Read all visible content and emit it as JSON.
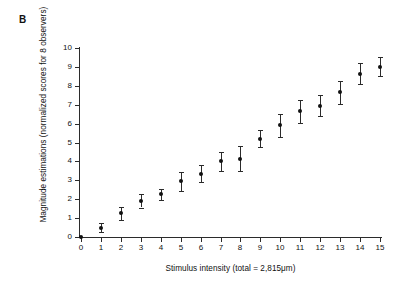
{
  "figure": {
    "panel_label": "B"
  },
  "chart_data": {
    "type": "scatter",
    "title": "",
    "subtitle": "",
    "xlabel": "Stimulus intensity (total = 2,815μm)",
    "ylabel": "Magnitude estimations (normalized scores for 8 observers)",
    "xlim": [
      0,
      15
    ],
    "ylim": [
      0,
      10
    ],
    "grid": false,
    "legend": null,
    "xticks": [
      "0",
      "1",
      "2",
      "3",
      "4",
      "5",
      "6",
      "7",
      "8",
      "9",
      "10",
      "11",
      "12",
      "13",
      "14",
      "15"
    ],
    "yticks": [
      "0",
      "1",
      "2",
      "3",
      "4",
      "5",
      "6",
      "7",
      "8",
      "9",
      "10"
    ],
    "marker_color": "#111111",
    "errorbar_color": "#2b2b2b",
    "axis_color": "#2b2b2b",
    "x": [
      0,
      1,
      2,
      3,
      4,
      5,
      6,
      7,
      8,
      9,
      10,
      11,
      12,
      13,
      14,
      15
    ],
    "y": [
      0.0,
      0.5,
      1.25,
      1.9,
      2.25,
      2.95,
      3.35,
      4.0,
      4.15,
      5.2,
      5.9,
      6.65,
      6.95,
      7.65,
      8.65,
      9.0
    ],
    "yerr": [
      0.0,
      0.25,
      0.35,
      0.35,
      0.3,
      0.5,
      0.45,
      0.5,
      0.65,
      0.45,
      0.6,
      0.6,
      0.55,
      0.6,
      0.55,
      0.5
    ],
    "points": [
      {
        "x": 0,
        "y": 0.0,
        "err": 0.0
      },
      {
        "x": 1,
        "y": 0.5,
        "err": 0.25
      },
      {
        "x": 2,
        "y": 1.25,
        "err": 0.35
      },
      {
        "x": 3,
        "y": 1.9,
        "err": 0.35
      },
      {
        "x": 4,
        "y": 2.25,
        "err": 0.3
      },
      {
        "x": 5,
        "y": 2.95,
        "err": 0.5
      },
      {
        "x": 6,
        "y": 3.35,
        "err": 0.45
      },
      {
        "x": 7,
        "y": 4.0,
        "err": 0.5
      },
      {
        "x": 8,
        "y": 4.15,
        "err": 0.65
      },
      {
        "x": 9,
        "y": 5.2,
        "err": 0.45
      },
      {
        "x": 10,
        "y": 5.9,
        "err": 0.6
      },
      {
        "x": 11,
        "y": 6.65,
        "err": 0.6
      },
      {
        "x": 12,
        "y": 6.95,
        "err": 0.55
      },
      {
        "x": 13,
        "y": 7.65,
        "err": 0.6
      },
      {
        "x": 14,
        "y": 8.65,
        "err": 0.55
      },
      {
        "x": 15,
        "y": 9.0,
        "err": 0.5
      }
    ]
  }
}
